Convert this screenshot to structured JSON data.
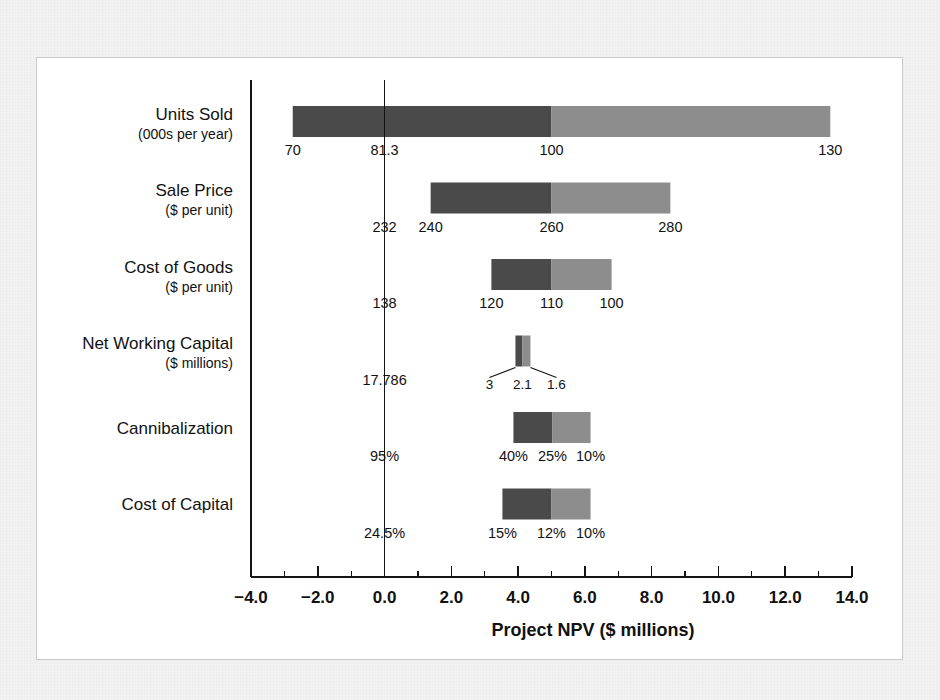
{
  "figure": {
    "background_color": "#f2f2f2",
    "panel_color": "#ffffff",
    "border_color": "#c9c9c9"
  },
  "colors": {
    "low_value_bar": "#4a4a4a",
    "high_value_bar": "#8d8d8d",
    "axis": "#141414",
    "text": "#111111"
  },
  "chart_data": {
    "type": "bar",
    "subtype": "tornado-sensitivity",
    "title": "",
    "xlabel": "Project NPV ($ millions)",
    "ylabel": "",
    "xlim": [
      -4.0,
      14.0
    ],
    "grid": false,
    "legend": "none",
    "base_case_npv": 5.0,
    "xticks": [
      -4.0,
      -2.0,
      0.0,
      2.0,
      4.0,
      6.0,
      8.0,
      10.0,
      12.0,
      14.0
    ],
    "xtick_labels": [
      "−4.0",
      "−2.0",
      "0.0",
      "2.0",
      "4.0",
      "6.0",
      "8.0",
      "10.0",
      "12.0",
      "14.0"
    ],
    "xminor_step": 1.0,
    "zero_line_at": 0.0,
    "categories": [
      {
        "name": "Units Sold",
        "label": "Units Sold",
        "sublabel": "(000s per year)",
        "npv_low": -2.75,
        "npv_base": 5.0,
        "npv_high": 13.35,
        "labels": {
          "low": "70",
          "breakeven": "81.3",
          "base": "100",
          "high": "130"
        },
        "label_style": "inline"
      },
      {
        "name": "Sale Price",
        "label": "Sale Price",
        "sublabel": "($ per unit)",
        "npv_low": 1.38,
        "npv_base": 5.0,
        "npv_high": 8.56,
        "labels": {
          "low": "240",
          "breakeven": "232",
          "base": "260",
          "high": "280"
        },
        "label_style": "inline"
      },
      {
        "name": "Cost of Goods",
        "label": "Cost of Goods",
        "sublabel": "($ per unit)",
        "npv_low": 3.2,
        "npv_base": 5.0,
        "npv_high": 6.8,
        "labels": {
          "low": "120",
          "breakeven": "138",
          "base": "110",
          "high": "100"
        },
        "label_style": "inline"
      },
      {
        "name": "Net Working Capital",
        "label": "Net Working Capital",
        "sublabel": "($ millions)",
        "npv_low": 3.92,
        "npv_base": 4.13,
        "npv_high": 4.37,
        "labels": {
          "low": "3",
          "breakeven": "17.786",
          "base": "2.1",
          "high": "1.6"
        },
        "label_style": "leader"
      },
      {
        "name": "Cannibalization",
        "label": "Cannibalization",
        "sublabel": "",
        "npv_low": 3.86,
        "npv_base": 5.03,
        "npv_high": 6.17,
        "labels": {
          "low": "40%",
          "breakeven": "95%",
          "base": "25%",
          "high": "10%"
        },
        "label_style": "inline"
      },
      {
        "name": "Cost of Capital",
        "label": "Cost of Capital",
        "sublabel": "",
        "npv_low": 3.53,
        "npv_base": 5.0,
        "npv_high": 6.17,
        "labels": {
          "low": "15%",
          "breakeven": "24.5%",
          "base": "12%",
          "high": "10%"
        },
        "label_style": "inline"
      }
    ]
  }
}
